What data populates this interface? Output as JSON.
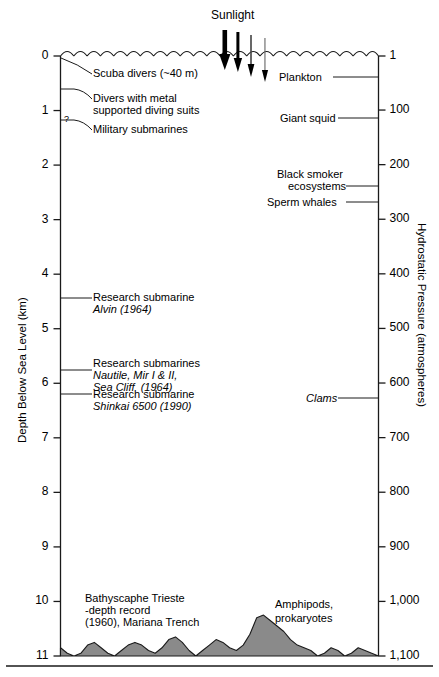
{
  "figure": {
    "title_sunlight": "Sunlight",
    "left_axis": {
      "title": "Depth Below Sea Level (km)",
      "unit": "km",
      "ticks": [
        0,
        1,
        2,
        3,
        4,
        5,
        6,
        7,
        8,
        9,
        10,
        11
      ],
      "tick_labels": [
        "0",
        "1",
        "2",
        "3",
        "4",
        "5",
        "6",
        "7",
        "8",
        "9",
        "10",
        "11"
      ],
      "uncertain_marker": "?"
    },
    "right_axis": {
      "title": "Hydrostatic Pressure (atmospheres)",
      "unit": "atmospheres",
      "ticks": [
        1,
        100,
        200,
        300,
        400,
        500,
        600,
        700,
        800,
        900,
        1000,
        1100
      ],
      "tick_labels": [
        "1",
        "100",
        "200",
        "300",
        "400",
        "500",
        "600",
        "700",
        "800",
        "900",
        "1,000",
        "1,100"
      ]
    },
    "left_annotations": [
      {
        "text": "Scuba divers (~40 m)",
        "depth_km": 0.04,
        "italic_part": ""
      },
      {
        "text": "Divers with metal\nsupported diving suits",
        "depth_km": 0.6,
        "italic_part": ""
      },
      {
        "text": "Military submarines",
        "depth_km": 1.0,
        "italic_part": ""
      },
      {
        "text": "Research submarine\nAlvin (1964)",
        "depth_km": 4.5,
        "italic_part": "Alvin"
      },
      {
        "text": "Research submarines\nNautile, Mir I & II,\nSea Cliff  (1964)",
        "depth_km": 6.0,
        "italic_part": "Nautile, Mir I & II, Sea Cliff"
      },
      {
        "text": "Research submarine\nShinkai 6500 (1990)",
        "depth_km": 6.5,
        "italic_part": "Shinkai 6500"
      },
      {
        "text": "Bathyscaphe Trieste\n-depth record\n(1960), Mariana Trench",
        "depth_km": 10.9,
        "italic_part": "Trieste"
      }
    ],
    "right_annotations": [
      {
        "text": "Plankton",
        "pressure_atm": 20
      },
      {
        "text": "Giant squid",
        "pressure_atm": 100
      },
      {
        "text": "Black smoker\necosystems",
        "pressure_atm": 220
      },
      {
        "text": "Sperm whales",
        "pressure_atm": 250
      },
      {
        "text": "Clams",
        "pressure_atm": 650
      },
      {
        "text": "Amphipods,\nprokaryotes",
        "pressure_atm": 1050
      }
    ],
    "annotation_lines": {
      "alvin_label_l1": "Research submarine",
      "alvin_label_l2": "Alvin (1964)",
      "nautile_l1": "Research submarines",
      "nautile_l2": "Nautile, Mir I & II,",
      "nautile_l3": "Sea Cliff  (1964)",
      "shinkai_l1": "Research submarine",
      "shinkai_l2": "Shinkai 6500 (1990)",
      "scuba": "Scuba divers (~40 m)",
      "divers_l1": "Divers with metal",
      "divers_l2": "supported diving suits",
      "military": "Military submarines",
      "trieste_l1a": "Bathyscaphe ",
      "trieste_l1b": "Trieste",
      "trieste_l2": "-depth record",
      "trieste_l3": "(1960), Mariana Trench",
      "plankton": "Plankton",
      "giant_squid": "Giant squid",
      "blacksmoker_l1": "Black smoker",
      "blacksmoker_l2": "ecosystems",
      "sperm_whales": "Sperm whales",
      "clams": "Clams",
      "amphipods_l1": "Amphipods,",
      "amphipods_l2": "prokaryotes"
    },
    "colors": {
      "seafloor_fill": "#8a8a8a",
      "line": "#1a1a1a",
      "background": "#ffffff"
    }
  },
  "chart_data": {
    "type": "line",
    "xlabel": "",
    "ylabel": "Depth Below Sea Level (km)",
    "y2label": "Hydrostatic Pressure (atmospheres)",
    "ylim": [
      0,
      11
    ],
    "y2lim": [
      1,
      1100
    ],
    "yticks": [
      0,
      1,
      2,
      3,
      4,
      5,
      6,
      7,
      8,
      9,
      10,
      11
    ],
    "y2ticks": [
      1,
      100,
      200,
      300,
      400,
      500,
      600,
      700,
      800,
      900,
      1000,
      1100
    ],
    "grid": false,
    "legend": "none",
    "series": [
      {
        "name": "Human / vehicle depth records (km)",
        "points": [
          {
            "label": "Scuba divers (~40 m)",
            "depth_km": 0.04
          },
          {
            "label": "Divers with metal supported diving suits",
            "depth_km": 0.6
          },
          {
            "label": "Military submarines",
            "depth_km": 1.0
          },
          {
            "label": "Research submarine Alvin (1964)",
            "depth_km": 4.5
          },
          {
            "label": "Research submarines Nautile, Mir I & II, Sea Cliff (1964)",
            "depth_km": 6.0
          },
          {
            "label": "Research submarine Shinkai 6500 (1990)",
            "depth_km": 6.5
          },
          {
            "label": "Bathyscaphe Trieste depth record (1960), Mariana Trench",
            "depth_km": 10.9
          }
        ]
      },
      {
        "name": "Marine life / ecosystems (atmospheres)",
        "points": [
          {
            "label": "Plankton",
            "pressure_atm": 20
          },
          {
            "label": "Giant squid",
            "pressure_atm": 100
          },
          {
            "label": "Black smoker ecosystems",
            "pressure_atm": 220
          },
          {
            "label": "Sperm whales",
            "pressure_atm": 250
          },
          {
            "label": "Clams",
            "pressure_atm": 650
          },
          {
            "label": "Amphipods, prokaryotes",
            "pressure_atm": 1050
          }
        ]
      }
    ],
    "annotations": [
      "Sunlight"
    ],
    "seafloor_profile_km": [
      10.85,
      10.95,
      11.0,
      10.95,
      10.8,
      10.75,
      10.85,
      10.95,
      11.0,
      10.9,
      10.8,
      10.75,
      10.8,
      10.9,
      10.95,
      10.85,
      10.7,
      10.65,
      10.75,
      10.9,
      11.0,
      10.9,
      10.8,
      10.7,
      10.75,
      10.85,
      10.9,
      10.8,
      10.6,
      10.3,
      10.25,
      10.35,
      10.45,
      10.55,
      10.7,
      10.8,
      10.85,
      10.9,
      11.0,
      10.95,
      10.85,
      10.9,
      11.0,
      10.95,
      10.85,
      10.9,
      10.95,
      11.0
    ]
  }
}
